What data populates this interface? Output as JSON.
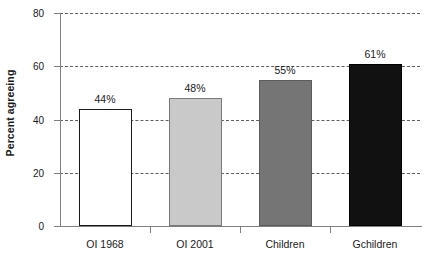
{
  "chart_data": {
    "type": "bar",
    "title": "",
    "subtitle": "",
    "xlabel": "",
    "ylabel": "Percent agreeing",
    "categories": [
      "OI 1968",
      "OI 2001",
      "Children",
      "Gchildren"
    ],
    "values": [
      44,
      48,
      55,
      61
    ],
    "data_labels": [
      "44%",
      "48%",
      "55%",
      "61%"
    ],
    "ylim": [
      0,
      80
    ],
    "yticks": [
      0,
      20,
      40,
      60,
      80
    ],
    "ytick_labels": [
      "0",
      "20",
      "40",
      "60",
      "80"
    ],
    "grid": "horizontal-dashed",
    "legend": "none",
    "bar_styles": [
      "open-white",
      "light-gray",
      "medium-gray",
      "black"
    ],
    "bar_colors": [
      "#ffffff",
      "#c9c9c9",
      "#757575",
      "#111111"
    ],
    "axis_color": "#808080",
    "gridline_color": "#5e5e5e",
    "text_color": "#1a1a1a"
  }
}
